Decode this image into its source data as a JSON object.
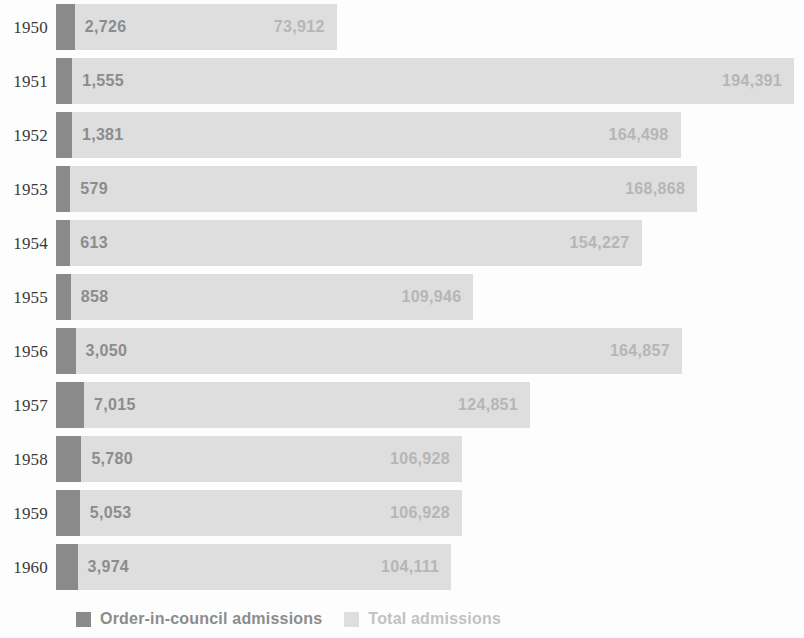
{
  "chart_data": {
    "type": "bar",
    "orientation": "horizontal",
    "title": "",
    "subtitle": "",
    "xlabel": "",
    "ylabel": "",
    "grid": false,
    "legend_position": "bottom-left",
    "xlim": [
      0,
      200000
    ],
    "categories": [
      "1950",
      "1951",
      "1952",
      "1953",
      "1954",
      "1955",
      "1956",
      "1957",
      "1958",
      "1959",
      "1960"
    ],
    "series": [
      {
        "name": "Order-in-council admissions",
        "color": "#8a8a8a",
        "values": [
          2726,
          1555,
          1381,
          579,
          613,
          858,
          3050,
          7015,
          5780,
          5053,
          3974
        ],
        "labels": [
          "2,726",
          "1,555",
          "1,381",
          "579",
          "613",
          "858",
          "3,050",
          "7,015",
          "5,780",
          "5,053",
          "3,974"
        ]
      },
      {
        "name": "Total admissions",
        "color": "#dedede",
        "values": [
          73912,
          194391,
          164498,
          168868,
          154227,
          109946,
          164857,
          124851,
          106928,
          106928,
          104111
        ],
        "labels": [
          "73,912",
          "194,391",
          "164,498",
          "168,868",
          "154,227",
          "109,946",
          "164,857",
          "124,851",
          "106,928",
          "106,928",
          "104,111"
        ]
      }
    ]
  },
  "legend": {
    "items": [
      {
        "label": "Order-in-council admissions",
        "swatch": "dark-gray-swatch-icon"
      },
      {
        "label": "Total admissions",
        "swatch": "light-gray-swatch-icon"
      }
    ]
  }
}
